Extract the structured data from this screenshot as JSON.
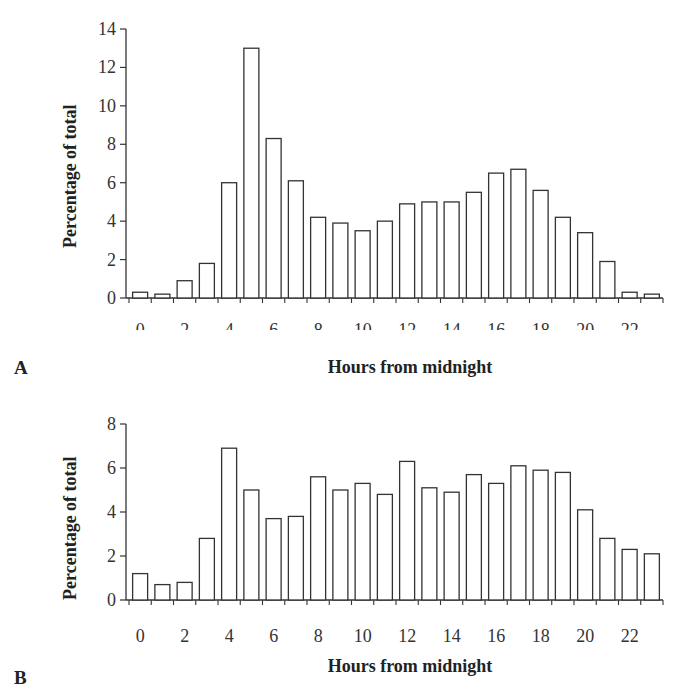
{
  "chart_data": [
    {
      "type": "bar",
      "panel": "A",
      "title": "",
      "xlabel": "Hours from midnight",
      "ylabel": "Percentage of total",
      "ylim": [
        0,
        14
      ],
      "yticks": [
        0,
        2,
        4,
        6,
        8,
        10,
        12,
        14
      ],
      "xtick_labels": [
        "0",
        "2",
        "4",
        "6",
        "8",
        "10",
        "12",
        "14",
        "16",
        "18",
        "20",
        "22"
      ],
      "categories": [
        0,
        1,
        2,
        3,
        4,
        5,
        6,
        7,
        8,
        9,
        10,
        11,
        12,
        13,
        14,
        15,
        16,
        17,
        18,
        19,
        20,
        21,
        22,
        23
      ],
      "values": [
        0.3,
        0.2,
        0.9,
        1.8,
        6.0,
        13.0,
        8.3,
        6.1,
        4.2,
        3.9,
        3.5,
        4.0,
        4.9,
        5.0,
        5.0,
        5.5,
        6.5,
        6.7,
        5.6,
        4.2,
        3.4,
        1.9,
        0.3,
        0.2
      ],
      "grid": false,
      "legend": null
    },
    {
      "type": "bar",
      "panel": "B",
      "title": "",
      "xlabel": "Hours from midnight",
      "ylabel": "Percentage of total",
      "ylim": [
        0,
        8
      ],
      "yticks": [
        0,
        2,
        4,
        6,
        8
      ],
      "xtick_labels": [
        "0",
        "2",
        "4",
        "6",
        "8",
        "10",
        "12",
        "14",
        "16",
        "18",
        "20",
        "22"
      ],
      "categories": [
        0,
        1,
        2,
        3,
        4,
        5,
        6,
        7,
        8,
        9,
        10,
        11,
        12,
        13,
        14,
        15,
        16,
        17,
        18,
        19,
        20,
        21,
        22,
        23
      ],
      "values": [
        1.2,
        0.7,
        0.8,
        2.8,
        6.9,
        5.0,
        3.7,
        3.8,
        5.6,
        5.0,
        5.3,
        4.8,
        6.3,
        5.1,
        4.9,
        5.7,
        5.3,
        6.1,
        5.9,
        5.8,
        4.1,
        2.8,
        2.3,
        2.1
      ],
      "grid": false,
      "legend": null
    }
  ],
  "panels": {
    "a": {
      "letter": "A",
      "xlabel": "Hours from midnight",
      "ylabel": "Percentage of total"
    },
    "b": {
      "letter": "B",
      "xlabel": "Hours from midnight",
      "ylabel": "Percentage of total"
    }
  }
}
